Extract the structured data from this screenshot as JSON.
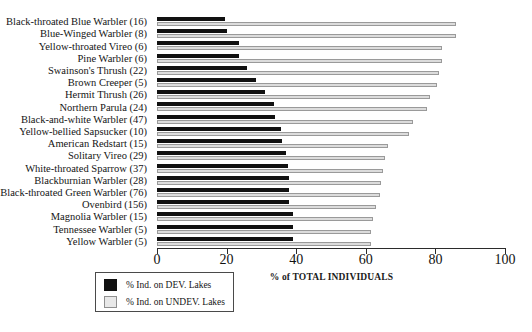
{
  "chart_data": {
    "type": "bar",
    "orientation": "horizontal",
    "title": "",
    "xlabel": "% of TOTAL INDIVIDUALS",
    "ylabel": "",
    "xlim": [
      0,
      100
    ],
    "xticks": [
      0,
      20,
      40,
      60,
      80,
      100
    ],
    "grid": false,
    "legend_position": "bottom-left",
    "categories": [
      "Black-throated Blue Warbler (16)",
      "Blue-Winged Warbler (8)",
      "Yellow-throated Vireo (6)",
      "Pine Warbler (6)",
      "Swainson's Thrush (22)",
      "Brown Creeper (5)",
      "Hermit Thrush (26)",
      "Northern Parula (24)",
      "Black-and-white Warbler (47)",
      "Yellow-bellied Sapsucker (10)",
      "American Redstart (15)",
      "Solitary Vireo (29)",
      "White-throated Sparrow (37)",
      "Blackburnian Warbler (28)",
      "Black-throated Green Warbler (76)",
      "Ovenbird (156)",
      "Magnolia Warbler (15)",
      "Tennessee Warbler (5)",
      "Yellow Warbler (5)"
    ],
    "series": [
      {
        "name": "% Ind. on DEV. Lakes",
        "color": "#111111",
        "values": [
          19.5,
          20.0,
          23.5,
          23.5,
          26.0,
          28.5,
          31.0,
          33.5,
          34.0,
          35.5,
          36.0,
          37.0,
          37.5,
          38.0,
          38.0,
          38.0,
          39.0,
          39.0,
          39.0
        ]
      },
      {
        "name": "% Ind. on UNDEV. Lakes",
        "color": "#dcdcdc",
        "values": [
          86.0,
          86.0,
          82.0,
          82.0,
          81.0,
          80.5,
          78.5,
          77.5,
          73.5,
          72.5,
          66.5,
          65.5,
          65.0,
          64.5,
          64.0,
          63.0,
          62.0,
          61.5,
          61.5
        ]
      }
    ]
  },
  "axis": {
    "tick_labels": [
      "0",
      "20",
      "40",
      "60",
      "80",
      "100"
    ],
    "title": "% of TOTAL INDIVIDUALS"
  },
  "legend": {
    "items": [
      {
        "label": "% Ind. on DEV. Lakes",
        "swatch": "black-square-swatch"
      },
      {
        "label": "% Ind. on UNDEV. Lakes",
        "swatch": "light-gray-square-swatch"
      }
    ]
  }
}
